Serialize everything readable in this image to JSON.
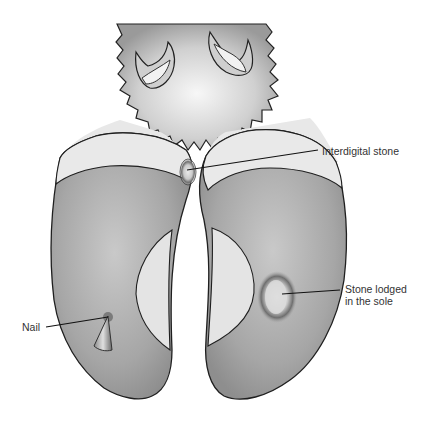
{
  "diagram": {
    "labels": {
      "interdigital": "Interdigital stone",
      "sole_line1": "Stone lodged",
      "sole_line2": "in the sole",
      "nail": "Nail"
    },
    "colors": {
      "outline": "#222222",
      "sole": "#a8a8a8",
      "heel": "#e6e6e6",
      "hair": "#bdbdbd",
      "background": "#ffffff"
    }
  }
}
